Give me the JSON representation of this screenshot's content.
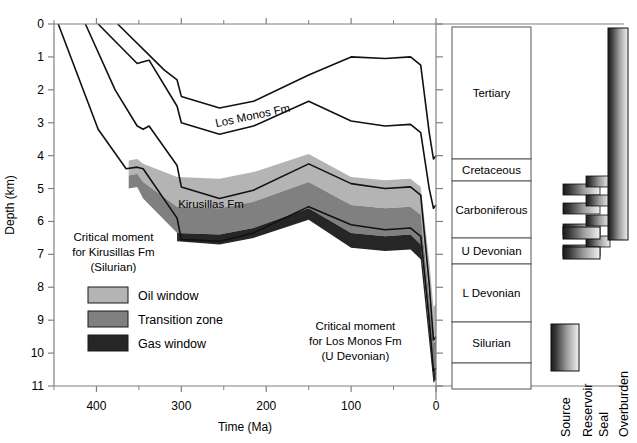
{
  "chart_data": {
    "type": "area",
    "xlabel": "Time (Ma)",
    "ylabel": "Depth (km)",
    "xlim": [
      450,
      0
    ],
    "ylim": [
      11,
      0
    ],
    "xticks": [
      400,
      300,
      200,
      100,
      0
    ],
    "xtick_labels": [
      "400",
      "300",
      "200",
      "100",
      "0"
    ],
    "xminor_ticks": [
      450,
      350,
      250,
      150,
      50
    ],
    "yticks": [
      0,
      1,
      2,
      3,
      4,
      5,
      6,
      7,
      8,
      9,
      10,
      11
    ],
    "ytick_labels": [
      "0",
      "1",
      "2",
      "3",
      "4",
      "5",
      "6",
      "7",
      "8",
      "9",
      "10",
      "11"
    ],
    "grid": false,
    "legend_position": "inside-lower-left",
    "axis_direction": {
      "x": "reversed (old to young, left to right)",
      "y": "inverted (depth increases downward)"
    },
    "horizon_curves": [
      {
        "name": "horizon-1-shallowest",
        "points": [
          [
            445,
            0
          ],
          [
            398,
            3.2
          ],
          [
            365,
            4.4
          ],
          [
            352,
            4.35
          ],
          [
            345,
            4.4
          ],
          [
            305,
            5.9
          ],
          [
            300,
            6.55
          ],
          [
            255,
            6.6
          ],
          [
            215,
            6.35
          ],
          [
            150,
            5.55
          ],
          [
            100,
            6.1
          ],
          [
            60,
            6.25
          ],
          [
            30,
            6.2
          ],
          [
            18,
            6.45
          ],
          [
            8,
            9.0
          ],
          [
            3,
            10.55
          ],
          [
            0,
            10.45
          ]
        ]
      },
      {
        "name": "horizon-2",
        "points": [
          [
            413,
            0
          ],
          [
            378,
            2.0
          ],
          [
            352,
            3.1
          ],
          [
            345,
            3.2
          ],
          [
            338,
            3.1
          ],
          [
            305,
            4.3
          ],
          [
            300,
            4.95
          ],
          [
            255,
            5.3
          ],
          [
            215,
            5.05
          ],
          [
            150,
            4.25
          ],
          [
            100,
            4.85
          ],
          [
            60,
            5.0
          ],
          [
            30,
            4.95
          ],
          [
            18,
            5.2
          ],
          [
            8,
            7.9
          ],
          [
            3,
            9.6
          ],
          [
            0,
            9.5
          ]
        ]
      },
      {
        "name": "horizon-3",
        "points": [
          [
            398,
            0
          ],
          [
            352,
            1.2
          ],
          [
            345,
            1.15
          ],
          [
            338,
            1.1
          ],
          [
            305,
            2.5
          ],
          [
            300,
            3.0
          ],
          [
            255,
            3.35
          ],
          [
            215,
            3.1
          ],
          [
            150,
            2.35
          ],
          [
            100,
            2.95
          ],
          [
            60,
            3.1
          ],
          [
            30,
            3.05
          ],
          [
            18,
            3.3
          ],
          [
            8,
            5.0
          ],
          [
            3,
            5.6
          ],
          [
            0,
            5.5
          ]
        ]
      },
      {
        "name": "horizon-4-shallowest-top",
        "points": [
          [
            375,
            0
          ],
          [
            320,
            1.4
          ],
          [
            305,
            1.7
          ],
          [
            300,
            2.2
          ],
          [
            255,
            2.55
          ],
          [
            215,
            2.35
          ],
          [
            150,
            1.55
          ],
          [
            100,
            1.0
          ],
          [
            60,
            1.05
          ],
          [
            30,
            1.0
          ],
          [
            18,
            1.25
          ],
          [
            8,
            3.3
          ],
          [
            3,
            4.1
          ],
          [
            0,
            4.0
          ]
        ]
      }
    ],
    "maturity_zones": [
      {
        "name": "Oil window",
        "color": "#b4b4b4",
        "top_points": [
          [
            362,
            4.15
          ],
          [
            352,
            4.1
          ],
          [
            345,
            4.25
          ],
          [
            305,
            4.65
          ],
          [
            255,
            4.7
          ],
          [
            215,
            4.5
          ],
          [
            150,
            3.95
          ],
          [
            100,
            4.65
          ],
          [
            60,
            4.75
          ],
          [
            30,
            4.7
          ],
          [
            18,
            4.95
          ],
          [
            8,
            7.2
          ],
          [
            3,
            8.6
          ],
          [
            0,
            8.5
          ]
        ],
        "bottom_points": [
          [
            362,
            4.6
          ],
          [
            352,
            4.55
          ],
          [
            345,
            4.8
          ],
          [
            305,
            5.55
          ],
          [
            255,
            5.6
          ],
          [
            215,
            5.4
          ],
          [
            150,
            4.8
          ],
          [
            100,
            5.5
          ],
          [
            60,
            5.6
          ],
          [
            30,
            5.55
          ],
          [
            18,
            5.8
          ],
          [
            8,
            8.3
          ],
          [
            3,
            9.7
          ],
          [
            0,
            9.6
          ]
        ]
      },
      {
        "name": "Transition zone",
        "color": "#808080",
        "top_points": [
          [
            362,
            4.6
          ],
          [
            352,
            4.55
          ],
          [
            345,
            4.8
          ],
          [
            305,
            5.55
          ],
          [
            255,
            5.6
          ],
          [
            215,
            5.4
          ],
          [
            150,
            4.8
          ],
          [
            100,
            5.5
          ],
          [
            60,
            5.6
          ],
          [
            30,
            5.55
          ],
          [
            18,
            5.8
          ],
          [
            8,
            8.3
          ],
          [
            3,
            9.7
          ],
          [
            0,
            9.6
          ]
        ],
        "bottom_points": [
          [
            362,
            5.0
          ],
          [
            352,
            4.95
          ],
          [
            345,
            5.3
          ],
          [
            305,
            6.35
          ],
          [
            255,
            6.4
          ],
          [
            215,
            6.2
          ],
          [
            150,
            5.6
          ],
          [
            100,
            6.35
          ],
          [
            60,
            6.45
          ],
          [
            30,
            6.4
          ],
          [
            18,
            6.7
          ],
          [
            8,
            9.25
          ],
          [
            3,
            10.6
          ],
          [
            0,
            10.5
          ]
        ]
      },
      {
        "name": "Gas window",
        "color": "#262626",
        "top_points": [
          [
            305,
            6.35
          ],
          [
            255,
            6.4
          ],
          [
            215,
            6.2
          ],
          [
            150,
            5.6
          ],
          [
            100,
            6.35
          ],
          [
            60,
            6.45
          ],
          [
            30,
            6.4
          ],
          [
            18,
            6.7
          ],
          [
            8,
            9.25
          ],
          [
            3,
            10.6
          ],
          [
            0,
            10.5
          ]
        ],
        "bottom_points": [
          [
            305,
            6.6
          ],
          [
            255,
            6.7
          ],
          [
            215,
            6.5
          ],
          [
            150,
            5.95
          ],
          [
            100,
            6.8
          ],
          [
            60,
            6.9
          ],
          [
            30,
            6.85
          ],
          [
            18,
            7.15
          ],
          [
            8,
            9.65
          ],
          [
            3,
            10.9
          ],
          [
            0,
            10.8
          ]
        ]
      }
    ],
    "annotations": [
      {
        "name": "los-monos-label",
        "text": "Los Monos Fm",
        "x_ma": 215,
        "depth_km": 2.9,
        "rotation_deg": -12
      },
      {
        "name": "kirusillas-label",
        "text": "Kirusillas Fm",
        "x_ma": 265,
        "depth_km": 5.6,
        "rotation_deg": 0
      },
      {
        "name": "critical-moment-kirusillas",
        "lines": [
          "Critical moment",
          "for Kirusillas Fm",
          "(Silurian)"
        ],
        "x_ma": 380,
        "depth_km": 6.6
      },
      {
        "name": "critical-moment-los-monos",
        "lines": [
          "Critical moment",
          "for Los Monos Fm",
          "(U Devonian)"
        ],
        "x_ma": 95,
        "depth_km": 9.3
      }
    ]
  },
  "axes": {
    "x_title": "Time (Ma)",
    "y_title": "Depth (km)",
    "x_labels": [
      "400",
      "300",
      "200",
      "100",
      "0"
    ],
    "y_labels": [
      "0",
      "1",
      "2",
      "3",
      "4",
      "5",
      "6",
      "7",
      "8",
      "9",
      "10",
      "11"
    ]
  },
  "legend": {
    "items": [
      {
        "label": "Oil window",
        "color": "#b4b4b4"
      },
      {
        "label": "Transition zone",
        "color": "#808080"
      },
      {
        "label": "Gas window",
        "color": "#262626"
      }
    ]
  },
  "critical_moments": {
    "kirusillas": {
      "line1": "Critical moment",
      "line2": "for Kirusillas Fm",
      "line3": "(Silurian)"
    },
    "los_monos": {
      "line1": "Critical moment",
      "line2": "for Los Monos Fm",
      "line3": "(U Devonian)"
    }
  },
  "formation_labels": {
    "los_monos": "Los Monos Fm",
    "kirusillas": "Kirusillas Fm"
  },
  "stratigraphic_column": {
    "rows": [
      {
        "name": "Tertiary",
        "label": "Tertiary",
        "top_px": 27,
        "bottom_px": 159
      },
      {
        "name": "Cretaceous",
        "label": "Cretaceous",
        "top_px": 159,
        "bottom_px": 181
      },
      {
        "name": "Carboniferous",
        "label": "Carboniferous",
        "top_px": 181,
        "bottom_px": 238
      },
      {
        "name": "U Devonian",
        "label": "U Devonian",
        "top_px": 238,
        "bottom_px": 264
      },
      {
        "name": "L Devonian",
        "label": "L Devonian",
        "top_px": 264,
        "bottom_px": 322
      },
      {
        "name": "Silurian",
        "label": "Silurian",
        "top_px": 322,
        "bottom_px": 363
      },
      {
        "name": "blank",
        "label": "",
        "top_px": 363,
        "bottom_px": 389
      }
    ]
  },
  "petroleum_system": {
    "labels": [
      "Source",
      "Reservoir",
      "Seal",
      "Overburden"
    ],
    "elements": [
      {
        "name": "Source",
        "x_px": 551,
        "y_px": 324,
        "w_px": 28,
        "h_px": 47
      },
      {
        "name": "Reservoir",
        "x_px": 563,
        "y_px": 247,
        "w_px": 37,
        "h_px": 12
      },
      {
        "name": "Seal",
        "x_px": 563,
        "y_px": 227,
        "w_px": 37,
        "h_px": 12
      },
      {
        "name": "Overburden",
        "x_px": 608,
        "y_px": 28,
        "w_px": 20,
        "h_px": 212
      }
    ],
    "connector_bars": [
      {
        "name": "bar-1",
        "x_px": 563,
        "y_px": 184,
        "w_px": 37,
        "h_px": 11
      },
      {
        "name": "bar-2",
        "x_px": 563,
        "y_px": 203,
        "w_px": 37,
        "h_px": 11
      },
      {
        "name": "bar-3",
        "x_px": 563,
        "y_px": 224,
        "w_px": 37,
        "h_px": 11
      },
      {
        "name": "bar-4",
        "x_px": 563,
        "y_px": 245,
        "w_px": 37,
        "h_px": 11
      },
      {
        "name": "bar-5",
        "x_px": 586,
        "y_px": 176,
        "w_px": 24,
        "h_px": 11
      },
      {
        "name": "bar-6",
        "x_px": 586,
        "y_px": 195,
        "w_px": 24,
        "h_px": 11
      },
      {
        "name": "bar-7",
        "x_px": 586,
        "y_px": 215,
        "w_px": 24,
        "h_px": 11
      },
      {
        "name": "bar-8",
        "x_px": 586,
        "y_px": 236,
        "w_px": 24,
        "h_px": 11
      }
    ]
  },
  "colors": {
    "oil_window": "#b4b4b4",
    "transition_zone": "#808080",
    "gas_window": "#262626",
    "axis": "#808080",
    "curve": "#111111",
    "box_border": "#555555"
  }
}
